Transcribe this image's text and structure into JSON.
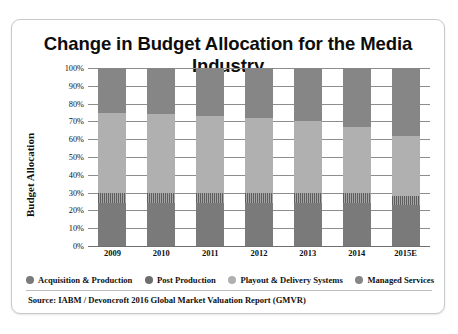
{
  "title": "Change in Budget Allocation for the Media Industry",
  "source": "Source: IABM / Devoncroft 2016 Global Market Valuation Report (GMVR)",
  "legend": [
    {
      "label": "Acquisition & Production",
      "color": "#7a7a7a"
    },
    {
      "label": "Post Production",
      "color": "#6e6e6e"
    },
    {
      "label": "Playout & Delivery Systems",
      "color": "#b0b0b0"
    },
    {
      "label": "Managed Services",
      "color": "#868686"
    }
  ],
  "chart_data": {
    "type": "bar",
    "stacked": true,
    "stack_total": 100,
    "title": "Change in Budget Allocation for the Media Industry",
    "xlabel": "",
    "ylabel": "Budget Allocation",
    "ylim": [
      0,
      100
    ],
    "yticks": [
      "0%",
      "10%",
      "20%",
      "30%",
      "40%",
      "50%",
      "60%",
      "70%",
      "80%",
      "90%",
      "100%"
    ],
    "ytick_values": [
      0,
      10,
      20,
      30,
      40,
      50,
      60,
      70,
      80,
      90,
      100
    ],
    "grid": true,
    "legend_position": "bottom",
    "categories": [
      "2009",
      "2010",
      "2011",
      "2012",
      "2013",
      "2014",
      "2015E"
    ],
    "series": [
      {
        "name": "Acquisition & Production",
        "color": "#7a7a7a",
        "values": [
          24,
          24,
          24,
          24,
          24,
          24,
          23
        ]
      },
      {
        "name": "Post Production",
        "color": "#6e6e6e",
        "values": [
          6,
          6,
          6,
          6,
          6,
          6,
          5
        ]
      },
      {
        "name": "Playout & Delivery Systems",
        "color": "#b0b0b0",
        "values": [
          45,
          44,
          43,
          42,
          40,
          37,
          34
        ]
      },
      {
        "name": "Managed Services",
        "color": "#868686",
        "values": [
          25,
          26,
          27,
          28,
          30,
          33,
          38
        ]
      }
    ]
  }
}
